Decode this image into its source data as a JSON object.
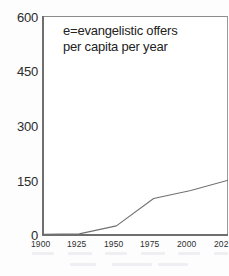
{
  "chart_data": {
    "type": "line",
    "title": "",
    "subtitle": "",
    "xlabel": "",
    "ylabel": "",
    "annotation_lines": [
      "e=evangelistic offers",
      "per capita per year"
    ],
    "grid": false,
    "legend": "none",
    "xlim": [
      1900,
      2025
    ],
    "ylim": [
      0,
      600
    ],
    "ytick_labels": [
      "600",
      "450",
      "300",
      "150",
      "0"
    ],
    "ytick_values": [
      600,
      450,
      300,
      150,
      0
    ],
    "xtick_labels": [
      "1900",
      "1925",
      "1950",
      "1975",
      "2000",
      "202"
    ],
    "xtick_values": [
      1900,
      1925,
      1950,
      1975,
      2000,
      2025
    ],
    "series": [
      {
        "name": "e",
        "x": [
          1900,
          1925,
          1950,
          1975,
          2000,
          2025
        ],
        "values": [
          2,
          3,
          25,
          100,
          122,
          150
        ]
      }
    ],
    "line_color": "#707070",
    "axis_color": "#6f6f6f",
    "frame_color": "#8c8c8c",
    "text_color": "#2b2b2b",
    "background": "#ffffff"
  },
  "axes": {
    "y_labels": [
      {
        "text": "600",
        "top": 11
      },
      {
        "text": "450",
        "top": 65
      },
      {
        "text": "300",
        "top": 120
      },
      {
        "text": "150",
        "top": 175
      },
      {
        "text": "0",
        "top": 229
      }
    ],
    "x_labels": [
      {
        "text": "1900",
        "left": 31
      },
      {
        "text": "1925",
        "left": 67
      },
      {
        "text": "1950",
        "left": 104
      },
      {
        "text": "1975",
        "left": 140
      },
      {
        "text": "2000",
        "left": 177
      },
      {
        "text": "202",
        "left": 214
      }
    ]
  }
}
